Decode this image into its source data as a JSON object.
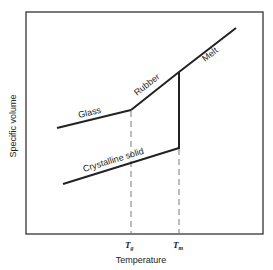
{
  "diagram": {
    "title": "",
    "xlabel": "Temperature",
    "ylabel": "Specific volume",
    "ticks": {
      "tg": {
        "main": "T",
        "sub": "g"
      },
      "tm": {
        "main": "T",
        "sub": "m"
      }
    },
    "regions": {
      "glass": "Glass",
      "rubber": "Rubber",
      "melt": "Melt",
      "crystalline": "Crystalline solid"
    },
    "colors": {
      "line": "#222222",
      "frame": "#333333",
      "dashed": "#777777"
    }
  }
}
